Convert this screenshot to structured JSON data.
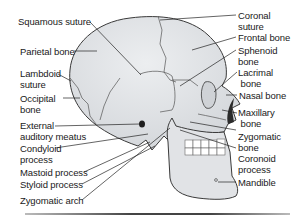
{
  "figure": {
    "colors": {
      "bone": "#e3e5e8",
      "outline": "#3a3a3a",
      "cavity": "#2b2b2b",
      "teeth": "#ffffff",
      "leader": "#222222"
    }
  },
  "labels_left": [
    {
      "id": "squamous-suture",
      "text": "Squamous suture"
    },
    {
      "id": "parietal-bone",
      "text": "Parietal bone"
    },
    {
      "id": "lambdoid-suture",
      "text": "Lambdoid\nsuture"
    },
    {
      "id": "occipital-bone",
      "text": "Occipital\nbone"
    },
    {
      "id": "external-auditory-meatus",
      "text": "External\nauditory meatus"
    },
    {
      "id": "condyloid-process",
      "text": "Condyloid\nprocess"
    },
    {
      "id": "mastoid-process",
      "text": "Mastoid process"
    },
    {
      "id": "styloid-process",
      "text": "Styloid process"
    },
    {
      "id": "zygomatic-arch",
      "text": "Zygomatic arch"
    }
  ],
  "labels_right": [
    {
      "id": "coronal-suture",
      "text": "Coronal\nsuture"
    },
    {
      "id": "frontal-bone",
      "text": "Frontal bone"
    },
    {
      "id": "sphenoid-bone",
      "text": "Sphenoid\nbone"
    },
    {
      "id": "lacrimal-bone",
      "text": "Lacrimal\n bone"
    },
    {
      "id": "nasal-bone",
      "text": "Nasal bone"
    },
    {
      "id": "maxillary-bone",
      "text": "Maxillary\n bone"
    },
    {
      "id": "zygomatic-bone",
      "text": "Zygomatic\nbone"
    },
    {
      "id": "coronoid-process",
      "text": "Coronoid\nprocess"
    },
    {
      "id": "mandible",
      "text": "Mandible"
    }
  ]
}
